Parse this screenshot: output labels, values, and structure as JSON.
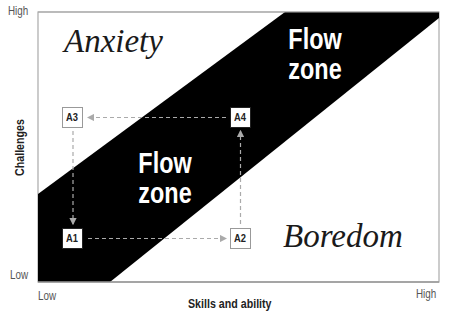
{
  "diagram": {
    "axes": {
      "x_title": "Skills and ability",
      "y_title": "Challenges",
      "x_low": "Low",
      "x_high": "High",
      "y_low": "Low",
      "y_high": "High"
    },
    "regions": {
      "anxiety": "Anxiety",
      "boredom": "Boredom",
      "flow_upper": {
        "line1": "Flow",
        "line2": "zone"
      },
      "flow_lower": {
        "line1": "Flow",
        "line2": "zone"
      }
    },
    "nodes": [
      {
        "id": "A1",
        "label": "A1",
        "x": 62,
        "y": 228,
        "border": "#222222"
      },
      {
        "id": "A2",
        "label": "A2",
        "x": 230,
        "y": 228,
        "border": "#999999"
      },
      {
        "id": "A3",
        "label": "A3",
        "x": 62,
        "y": 107,
        "border": "#999999"
      },
      {
        "id": "A4",
        "label": "A4",
        "x": 230,
        "y": 107,
        "border": "#222222"
      }
    ],
    "edges": [
      {
        "from": "A3",
        "to": "A1",
        "direction": "down"
      },
      {
        "from": "A1",
        "to": "A2",
        "direction": "right"
      },
      {
        "from": "A2",
        "to": "A4",
        "direction": "up"
      },
      {
        "from": "A4",
        "to": "A3",
        "direction": "left"
      }
    ],
    "colors": {
      "flow_band": "#000000",
      "background": "#ffffff",
      "frame": "#aaaaaa",
      "arrow": "#aaaaaa"
    }
  }
}
